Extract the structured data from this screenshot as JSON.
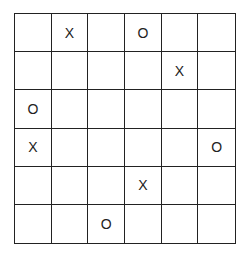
{
  "board": {
    "rows": 6,
    "cols": 6,
    "cells": [
      [
        "",
        "X",
        "",
        "O",
        "",
        ""
      ],
      [
        "",
        "",
        "",
        "",
        "X",
        ""
      ],
      [
        "O",
        "",
        "",
        "",
        "",
        ""
      ],
      [
        "X",
        "",
        "",
        "",
        "",
        "O"
      ],
      [
        "",
        "",
        "",
        "X",
        "",
        ""
      ],
      [
        "",
        "",
        "O",
        "",
        "",
        ""
      ]
    ]
  }
}
